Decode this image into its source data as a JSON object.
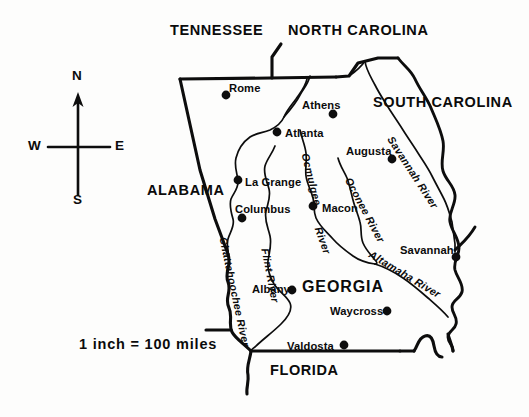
{
  "map": {
    "title": "Georgia state map with rivers and cities",
    "background_color": "#fdfdfc",
    "ink_color": "#0d0d0d",
    "scale": {
      "text": "1 inch = 100 miles"
    },
    "compass": {
      "north": "N",
      "south": "S",
      "east": "E",
      "west": "W"
    },
    "states": [
      {
        "name": "TENNESSEE",
        "x": 170,
        "y": 23,
        "size": "normal"
      },
      {
        "name": "NORTH CAROLINA",
        "x": 288,
        "y": 23,
        "size": "normal"
      },
      {
        "name": "SOUTH CAROLINA",
        "x": 373,
        "y": 95,
        "size": "normal"
      },
      {
        "name": "ALABAMA",
        "x": 147,
        "y": 183,
        "size": "normal"
      },
      {
        "name": "GEORGIA",
        "x": 302,
        "y": 279,
        "size": "big"
      },
      {
        "name": "FLORIDA",
        "x": 270,
        "y": 363,
        "size": "normal"
      }
    ],
    "cities": [
      {
        "name": "Rome",
        "label_x": 229,
        "label_y": 83,
        "dot_x": 226,
        "dot_y": 95
      },
      {
        "name": "Athens",
        "label_x": 302,
        "label_y": 100,
        "dot_x": 333,
        "dot_y": 114
      },
      {
        "name": "Atlanta",
        "label_x": 285,
        "label_y": 128,
        "dot_x": 277,
        "dot_y": 132
      },
      {
        "name": "Augusta",
        "label_x": 346,
        "label_y": 146,
        "dot_x": 392,
        "dot_y": 159
      },
      {
        "name": "La Grange",
        "label_x": 245,
        "label_y": 177,
        "dot_x": 238,
        "dot_y": 180
      },
      {
        "name": "Columbus",
        "label_x": 235,
        "label_y": 204,
        "dot_x": 242,
        "dot_y": 218
      },
      {
        "name": "Macon",
        "label_x": 322,
        "label_y": 203,
        "dot_x": 313,
        "dot_y": 206
      },
      {
        "name": "Savannah",
        "label_x": 400,
        "label_y": 245,
        "dot_x": 456,
        "dot_y": 257
      },
      {
        "name": "Albany",
        "label_x": 252,
        "label_y": 284,
        "dot_x": 292,
        "dot_y": 290
      },
      {
        "name": "Waycross",
        "label_x": 330,
        "label_y": 306,
        "dot_x": 387,
        "dot_y": 311
      },
      {
        "name": "Valdosta",
        "label_x": 287,
        "label_y": 341,
        "dot_x": 344,
        "dot_y": 345
      }
    ],
    "rivers": [
      {
        "name": "Chattahoochee River",
        "x": 223,
        "y": 232,
        "rotate": 78
      },
      {
        "name": "Flint River",
        "x": 265,
        "y": 243,
        "rotate": 79
      },
      {
        "name": "Ocmulgee",
        "x": 305,
        "y": 148,
        "rotate": 76
      },
      {
        "name": "River",
        "x": 318,
        "y": 222,
        "rotate": 70
      },
      {
        "name": "Oconee River",
        "x": 348,
        "y": 173,
        "rotate": 62
      },
      {
        "name": "Savannah River",
        "x": 390,
        "y": 132,
        "rotate": 57
      },
      {
        "name": "Altamaha River",
        "x": 370,
        "y": 248,
        "rotate": 31
      }
    ]
  }
}
